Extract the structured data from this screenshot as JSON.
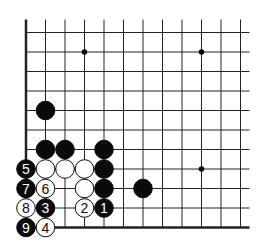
{
  "diagram": {
    "type": "go-board-fragment",
    "corner": "bottom-left",
    "grid": {
      "cols": 12,
      "rows": 11,
      "origin_x": 26,
      "origin_y": 32.5,
      "spacing": 19.5,
      "open_top": true,
      "open_right": true
    },
    "colors": {
      "line": "#222222",
      "black": "#0a0a0a",
      "white": "#ffffff",
      "background": "#ffffff"
    },
    "star_points": [
      {
        "col": 3,
        "row": 1
      },
      {
        "col": 9,
        "row": 1
      },
      {
        "col": 9,
        "row": 7
      }
    ],
    "stones": [
      {
        "col": 1,
        "row": 4,
        "color": "black",
        "label": ""
      },
      {
        "col": 1,
        "row": 6,
        "color": "black",
        "label": ""
      },
      {
        "col": 2,
        "row": 6,
        "color": "black",
        "label": ""
      },
      {
        "col": 4,
        "row": 6,
        "color": "black",
        "label": ""
      },
      {
        "col": 0,
        "row": 7,
        "color": "black",
        "label": "5"
      },
      {
        "col": 1,
        "row": 7,
        "color": "white",
        "label": ""
      },
      {
        "col": 2,
        "row": 7,
        "color": "white",
        "label": ""
      },
      {
        "col": 3,
        "row": 7,
        "color": "white",
        "label": ""
      },
      {
        "col": 4,
        "row": 7,
        "color": "black",
        "label": ""
      },
      {
        "col": 0,
        "row": 8,
        "color": "black",
        "label": "7"
      },
      {
        "col": 1,
        "row": 8,
        "color": "white",
        "label": "6"
      },
      {
        "col": 3,
        "row": 8,
        "color": "white",
        "label": ""
      },
      {
        "col": 4,
        "row": 8,
        "color": "black",
        "label": ""
      },
      {
        "col": 6,
        "row": 8,
        "color": "black",
        "label": ""
      },
      {
        "col": 0,
        "row": 9,
        "color": "white",
        "label": "8"
      },
      {
        "col": 1,
        "row": 9,
        "color": "black",
        "label": "3"
      },
      {
        "col": 3,
        "row": 9,
        "color": "white",
        "label": "2"
      },
      {
        "col": 4,
        "row": 9,
        "color": "black",
        "label": "1"
      },
      {
        "col": 0,
        "row": 10,
        "color": "black",
        "label": "9"
      },
      {
        "col": 1,
        "row": 10,
        "color": "white",
        "label": "4"
      }
    ]
  }
}
